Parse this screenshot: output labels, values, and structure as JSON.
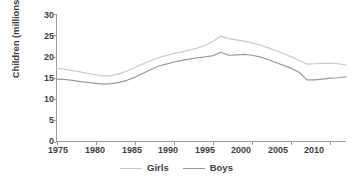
{
  "chart_data": {
    "type": "line",
    "title": "",
    "xlabel": "",
    "ylabel": "Children (millions)",
    "xlim": [
      1975,
      2012
    ],
    "ylim": [
      0,
      30
    ],
    "grid": false,
    "legend_position": "bottom-center",
    "xticks": [
      1975,
      1980,
      1985,
      1990,
      1995,
      2000,
      2005,
      2010
    ],
    "yticks": [
      0,
      5,
      10,
      15,
      20,
      25,
      30
    ],
    "x": [
      1975,
      1976,
      1977,
      1978,
      1979,
      1980,
      1981,
      1982,
      1983,
      1984,
      1985,
      1986,
      1987,
      1988,
      1989,
      1990,
      1991,
      1992,
      1993,
      1994,
      1995,
      1996,
      1997,
      1998,
      1999,
      2000,
      2001,
      2002,
      2003,
      2004,
      2005,
      2006,
      2007,
      2008,
      2009,
      2010,
      2011,
      2012
    ],
    "series": [
      {
        "name": "Girls",
        "color": "#c9c9c9",
        "values": [
          17.2,
          17.0,
          16.7,
          16.4,
          16.0,
          15.7,
          15.4,
          15.5,
          15.9,
          16.6,
          17.4,
          18.2,
          19.0,
          19.7,
          20.2,
          20.7,
          21.1,
          21.5,
          22.0,
          22.6,
          23.6,
          24.8,
          24.2,
          23.9,
          23.6,
          23.2,
          22.7,
          22.1,
          21.4,
          20.7,
          19.9,
          19.1,
          18.2,
          18.3,
          18.4,
          18.4,
          18.3,
          18.0
        ]
      },
      {
        "name": "Boys",
        "color": "#9a9a9a",
        "values": [
          14.7,
          14.6,
          14.4,
          14.1,
          13.9,
          13.7,
          13.5,
          13.6,
          13.9,
          14.4,
          15.1,
          16.0,
          16.9,
          17.7,
          18.2,
          18.7,
          19.1,
          19.4,
          19.7,
          19.9,
          20.2,
          21.0,
          20.3,
          20.4,
          20.5,
          20.3,
          19.9,
          19.3,
          18.6,
          17.9,
          17.2,
          16.3,
          14.5,
          14.5,
          14.7,
          14.9,
          15.0,
          15.2
        ]
      }
    ]
  },
  "axes": {
    "y_axis_label": "Children (millions)",
    "y_tick_labels": [
      "0",
      "5",
      "10",
      "15",
      "20",
      "25",
      "30"
    ],
    "x_tick_labels": [
      "1975",
      "1980",
      "1985",
      "1990",
      "1995",
      "2000",
      "2005",
      "2010"
    ]
  },
  "legend": {
    "items": [
      {
        "label": "Girls",
        "color": "#c9c9c9"
      },
      {
        "label": "Boys",
        "color": "#9a9a9a"
      }
    ]
  },
  "style": {
    "axis_color": "#9a9a9a",
    "text_color": "#3f3f3f",
    "background": "#ffffff"
  }
}
